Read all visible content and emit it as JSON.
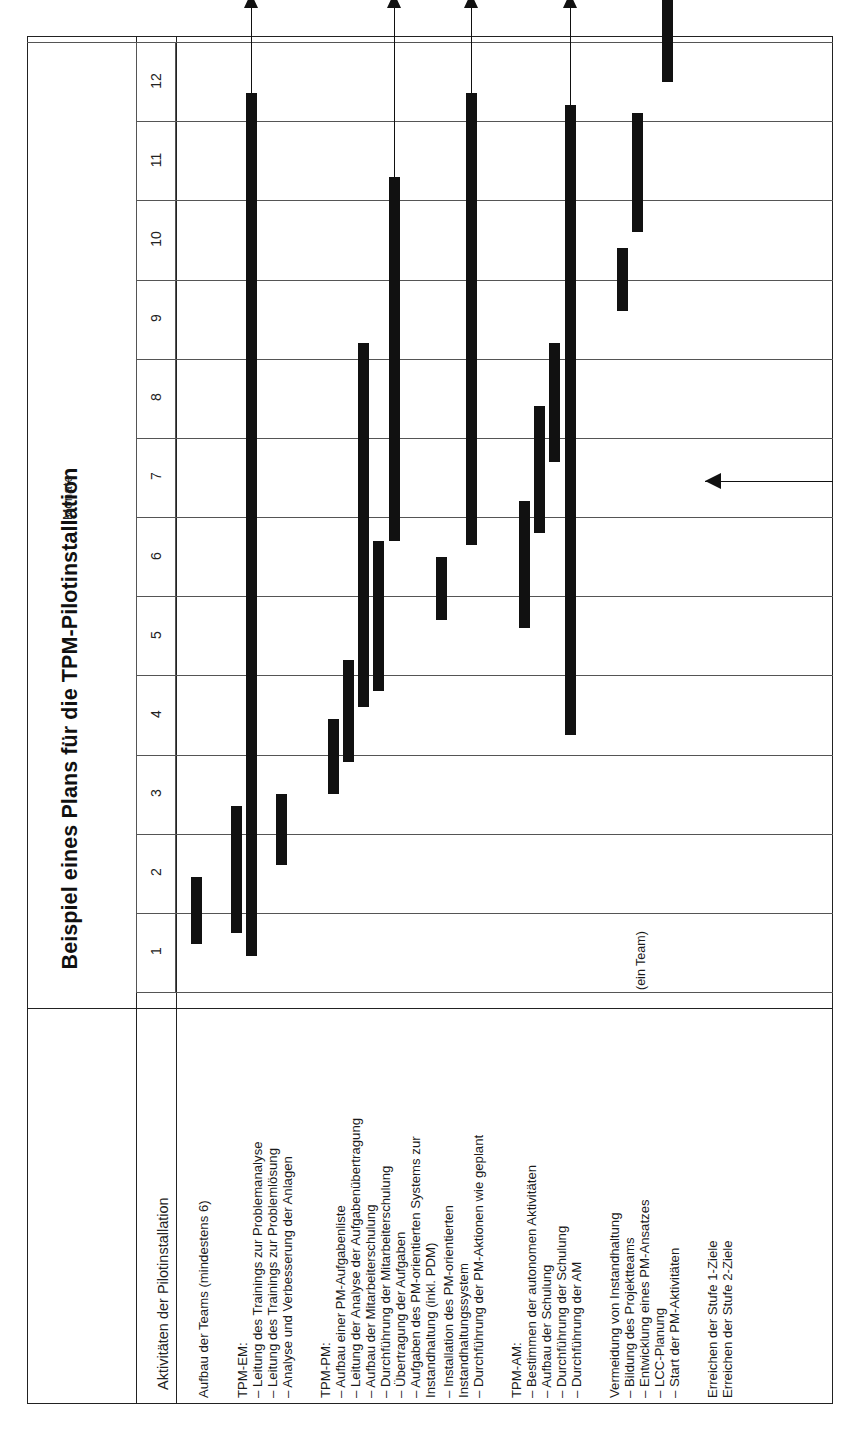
{
  "title": "Beispiel eines Plans für die TPM-Pilotinstallation",
  "axis": {
    "time_caption": "Monate",
    "activities_caption": "Aktivitäten der Pilotinstallation",
    "month_labels": [
      "1",
      "2",
      "3",
      "4",
      "5",
      "6",
      "7",
      "8",
      "9",
      "10",
      "11",
      "12"
    ]
  },
  "annotations": [
    {
      "text": "(ein Team)",
      "row": 14
    }
  ],
  "chart_data": {
    "type": "bar",
    "orientation": "gantt-vertical-time",
    "title": "Beispiel eines Plans für die TPM-Pilotinstallation",
    "xlabel": "Aktivitäten der Pilotinstallation",
    "ylabel": "Monate",
    "ylim": [
      0,
      12
    ],
    "grid": true,
    "legend": "none",
    "tick_labels": [
      "1",
      "2",
      "3",
      "4",
      "5",
      "6",
      "7",
      "8",
      "9",
      "10",
      "11",
      "12"
    ],
    "groups": [
      {
        "label": "",
        "header": "",
        "rows": [
          0
        ]
      },
      {
        "label": "TPM-EM:",
        "header": "TPM-EM:",
        "rows": [
          1,
          2,
          3
        ]
      },
      {
        "label": "TPM-PM:",
        "header": "TPM-PM:",
        "rows": [
          4,
          5,
          6,
          7,
          8,
          9,
          10
        ]
      },
      {
        "label": "TPM-AM:",
        "header": "TPM-AM:",
        "rows": [
          11,
          12,
          13,
          14
        ]
      },
      {
        "label": "Vermeidung von Instandhaltung",
        "header": "Vermeidung von Instandhaltung",
        "rows": [
          15,
          16,
          17,
          18
        ]
      },
      {
        "label": "",
        "header": "",
        "rows": [
          19,
          20
        ]
      }
    ],
    "rows": [
      {
        "label": "Aufbau der Teams (mindestens 6)",
        "start": 0.6,
        "end": 1.45,
        "arrow": "none"
      },
      {
        "label": "– Leitung des Trainings zur Problemanalyse",
        "start": 0.75,
        "end": 2.35,
        "arrow": "none"
      },
      {
        "label": "– Leitung des Trainings zur Problemlösung",
        "start": 0.45,
        "end": 11.35,
        "arrow": "up"
      },
      {
        "label": "– Analyse und Verbesserung der Anlagen",
        "start": 1.6,
        "end": 2.5,
        "arrow": "none"
      },
      {
        "label": "– Aufbau einer PM-Aufgabenliste",
        "start": 2.5,
        "end": 3.45,
        "arrow": "none"
      },
      {
        "label": "– Leitung der Analyse der Aufgabenübertragung",
        "start": 2.9,
        "end": 4.2,
        "arrow": "none"
      },
      {
        "label": "– Aufbau der Mitarbeiterschulung",
        "start": 3.6,
        "end": 8.2,
        "arrow": "none"
      },
      {
        "label": "– Durchführung der Mitarbeiterschulung",
        "start": 3.8,
        "end": 5.7,
        "arrow": "none"
      },
      {
        "label": "– Übertragung der Aufgaben",
        "start": 5.7,
        "end": 10.3,
        "arrow": "up"
      },
      {
        "label": "– Aufgaben des PM-orientierten Systems zur Instandhaltung (inkl. PDM)",
        "start": null,
        "end": null,
        "arrow": "none"
      },
      {
        "label": "– Installation des PM-orientierten Instandhaltungssystem",
        "start": 4.7,
        "end": 5.5,
        "arrow": "none"
      },
      {
        "label": "– Durchführung der PM-Aktionen wie geplant",
        "start": 5.65,
        "end": 11.35,
        "arrow": "up"
      },
      {
        "label": "– Bestimmen der autonomen Aktivitäten",
        "start": 4.6,
        "end": 6.2,
        "arrow": "none"
      },
      {
        "label": "– Aufbau der Schulung",
        "start": 5.8,
        "end": 7.4,
        "arrow": "none"
      },
      {
        "label": "– Durchführung der Schulung",
        "start": 6.7,
        "end": 8.2,
        "arrow": "none"
      },
      {
        "label": "– Durchführung der AM",
        "start": 3.25,
        "end": 11.2,
        "arrow": "up"
      },
      {
        "label": "– Bildung des Projektteams",
        "start": 8.6,
        "end": 9.4,
        "arrow": "none"
      },
      {
        "label": "– Entwicklung eines PM-Ansatzes",
        "start": 9.6,
        "end": 11.1,
        "arrow": "none"
      },
      {
        "label": "– LCC-Planung",
        "start": null,
        "end": null,
        "arrow": "none"
      },
      {
        "label": "– Start der PM-Aktivitäten",
        "start": 11.5,
        "end": 12.55,
        "arrow": "none"
      },
      {
        "label": "Erreichen der Stufe 1-Ziele",
        "start": null,
        "end": null,
        "arrow": "left",
        "milestone": 6.45
      },
      {
        "label": "Erreichen der Stufe 2-Ziele",
        "start": null,
        "end": null,
        "arrow": "none"
      }
    ]
  },
  "labels_layout": {
    "column_header": "Aktivitäten der Pilotinstallation",
    "entries": [
      {
        "text": "Aufbau der Teams (mindestens 6)",
        "x": 196
      },
      {
        "text": "TPM-EM:",
        "x": 235
      },
      {
        "text": "– Leitung des Trainings zur Problemanalyse",
        "x": 250
      },
      {
        "text": "– Leitung des Trainings zur Problemlösung",
        "x": 265
      },
      {
        "text": "– Analyse und Verbesserung der Anlagen",
        "x": 280
      },
      {
        "text": "TPM-PM:",
        "x": 318
      },
      {
        "text": "– Aufbau einer PM-Aufgabenliste",
        "x": 333
      },
      {
        "text": "– Leitung der Analyse der Aufgabenübertragung",
        "x": 348
      },
      {
        "text": "– Aufbau der Mitarbeiterschulung",
        "x": 363
      },
      {
        "text": "– Durchführung der Mitarbeiterschulung",
        "x": 378
      },
      {
        "text": "– Übertragung der Aufgaben",
        "x": 393
      },
      {
        "text": "– Aufgaben des PM-orientierten Systems zur",
        "x": 408
      },
      {
        "text": "Instandhaltung (inkl. PDM)",
        "x": 423
      },
      {
        "text": "– Installation des PM-orientierten",
        "x": 441
      },
      {
        "text": "Instandhaltungssystem",
        "x": 456
      },
      {
        "text": "– Durchführung der PM-Aktionen wie geplant",
        "x": 471
      },
      {
        "text": "TPM-AM:",
        "x": 509
      },
      {
        "text": "– Bestimmen der autonomen Aktivitäten",
        "x": 524
      },
      {
        "text": "– Aufbau der Schulung",
        "x": 539
      },
      {
        "text": "– Durchführung der Schulung",
        "x": 554
      },
      {
        "text": "– Durchführung der AM",
        "x": 569
      },
      {
        "text": "Vermeidung von Instandhaltung",
        "x": 607
      },
      {
        "text": "– Bildung des Projektteams",
        "x": 622
      },
      {
        "text": "– Entwicklung eines PM-Ansatzes",
        "x": 637
      },
      {
        "text": "– LCC-Planung",
        "x": 652
      },
      {
        "text": "– Start der PM-Aktivitäten",
        "x": 667
      },
      {
        "text": "Erreichen der Stufe 1-Ziele",
        "x": 705
      },
      {
        "text": "Erreichen der Stufe 2-Ziele",
        "x": 720
      }
    ]
  },
  "colors": {
    "bar": "#111111",
    "grid": "#555555",
    "frame": "#222222",
    "background": "#ffffff"
  }
}
